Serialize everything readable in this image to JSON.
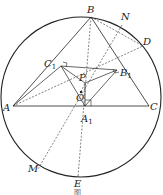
{
  "figure": {
    "caption": "图",
    "circle": {
      "cx": 81,
      "cy": 97,
      "r": 80
    },
    "points": {
      "B": {
        "label": "B",
        "x": 91,
        "y": 17
      },
      "N": {
        "label": "N",
        "x": 122,
        "y": 25
      },
      "D": {
        "label": "D",
        "x": 143,
        "y": 46
      },
      "C": {
        "label": "C",
        "x": 149,
        "y": 106
      },
      "A": {
        "label": "A",
        "x": 13,
        "y": 106
      },
      "M": {
        "label": "M",
        "x": 38,
        "y": 169
      },
      "E": {
        "label": "E",
        "x": 78,
        "y": 177
      },
      "C1": {
        "label": "C",
        "sub": "1",
        "x": 61,
        "y": 66
      },
      "B1": {
        "label": "B",
        "sub": "1",
        "x": 117,
        "y": 70
      },
      "P": {
        "label": "P",
        "x": 85,
        "y": 83
      },
      "O": {
        "label": "O",
        "x": 81,
        "y": 92
      },
      "A1": {
        "label": "A",
        "sub": "1",
        "x": 85,
        "y": 106
      }
    }
  }
}
